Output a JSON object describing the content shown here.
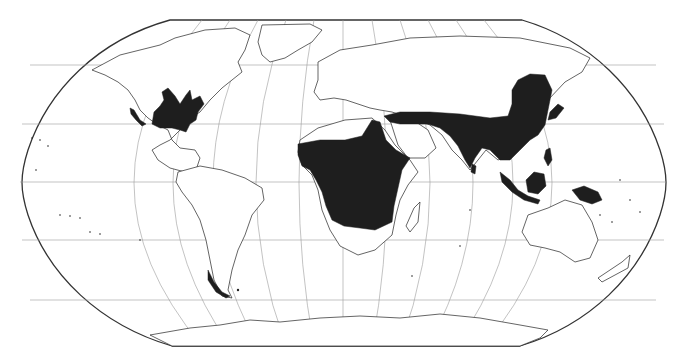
{
  "map": {
    "projection": "Robinson (world)",
    "title": "",
    "legend": [],
    "colors": {
      "background": "#ffffff",
      "frame": "#333333",
      "graticule": "#9a9a9a",
      "coastline": "#222222",
      "range_fill": "#1e1e1e"
    },
    "graticule": {
      "meridian_spacing_deg": 30,
      "parallel_spacing_deg": 30
    },
    "highlighted_regions": [
      "Eastern North America",
      "Sub-Saharan Africa",
      "Arabian Peninsula southern fringe",
      "South Asia",
      "East Asia",
      "Southeast Asia",
      "New Guinea"
    ]
  }
}
